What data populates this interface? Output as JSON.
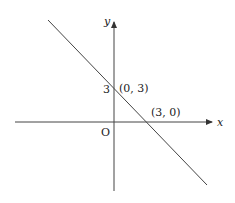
{
  "diagram": {
    "type": "coordinate-plane-line",
    "axes": {
      "x_label": "x",
      "y_label": "y",
      "origin_label": "O"
    },
    "y_tick_label": "3",
    "points": [
      {
        "label": "(0, 3)",
        "x": 0,
        "y": 3
      },
      {
        "label": "(3, 0)",
        "x": 3,
        "y": 0
      }
    ],
    "line": {
      "equation": "x + y = 3",
      "slope": -1,
      "intercept": 3
    },
    "colors": {
      "stroke": "#333333",
      "background": "#ffffff"
    }
  }
}
